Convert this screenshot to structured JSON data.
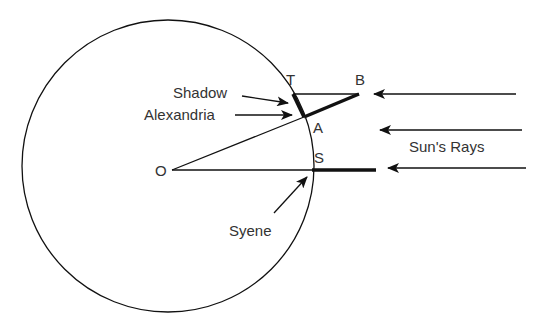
{
  "diagram": {
    "labels": {
      "T": "T",
      "B": "B",
      "A": "A",
      "S": "S",
      "O": "O",
      "shadow": "Shadow",
      "alexandria": "Alexandria",
      "syene": "Syene",
      "sun_rays": "Sun's Rays"
    },
    "colors": {
      "line": "#111111",
      "text": "#333333",
      "background": "#ffffff"
    }
  }
}
